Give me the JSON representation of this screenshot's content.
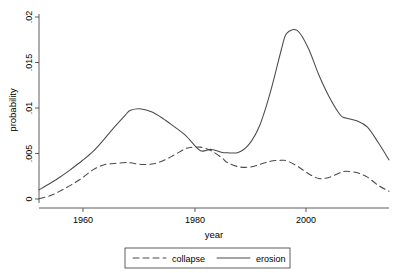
{
  "chart_data": {
    "type": "line",
    "title": "",
    "xlabel": "year",
    "ylabel": "probability",
    "xlim": [
      1950,
      2015
    ],
    "ylim": [
      0,
      0.02
    ],
    "grid": false,
    "legend_position": "bottom",
    "xticks": [
      1960,
      1980,
      2000
    ],
    "xtick_labels": [
      "1960",
      "1980",
      "2000"
    ],
    "yticks": [
      0,
      0.005,
      0.01,
      0.015,
      0.02
    ],
    "ytick_labels": [
      "0",
      ".005",
      ".01",
      ".015",
      ".02"
    ],
    "x": [
      1950,
      1952,
      1954,
      1956,
      1958,
      1960,
      1962,
      1964,
      1966,
      1967,
      1969,
      1971,
      1973,
      1975,
      1977,
      1978,
      1980,
      1982,
      1984,
      1985,
      1987,
      1989,
      1991,
      1993,
      1995,
      1996,
      1998,
      2000,
      2002,
      2004,
      2006,
      2007,
      2009,
      2011,
      2013,
      2015
    ],
    "series": [
      {
        "name": "collapse",
        "style": "dashed",
        "color": "#4a4a4a",
        "values": [
          2e-05,
          0.00035,
          0.0009,
          0.00155,
          0.0023,
          0.0032,
          0.00375,
          0.0039,
          0.004,
          0.00398,
          0.0038,
          0.00385,
          0.0042,
          0.0048,
          0.00548,
          0.00565,
          0.0057,
          0.0053,
          0.0045,
          0.004,
          0.00355,
          0.0035,
          0.0038,
          0.00415,
          0.00425,
          0.0042,
          0.0036,
          0.0028,
          0.00225,
          0.0024,
          0.0029,
          0.00305,
          0.0029,
          0.0024,
          0.0015,
          0.00085
        ]
      },
      {
        "name": "erosion",
        "style": "solid",
        "color": "#4a4a4a",
        "values": [
          0.001,
          0.0017,
          0.00245,
          0.0033,
          0.0042,
          0.0052,
          0.0065,
          0.0079,
          0.0092,
          0.00975,
          0.0099,
          0.00955,
          0.00885,
          0.008,
          0.0071,
          0.0065,
          0.0053,
          0.00545,
          0.00512,
          0.00508,
          0.00512,
          0.006,
          0.0081,
          0.0118,
          0.0164,
          0.0182,
          0.0185,
          0.0166,
          0.0136,
          0.0111,
          0.0092,
          0.0089,
          0.0086,
          0.0079,
          0.0062,
          0.0043
        ]
      }
    ],
    "legend_entries": [
      {
        "label": "collapse",
        "style": "dashed"
      },
      {
        "label": "erosion",
        "style": "solid"
      }
    ]
  }
}
